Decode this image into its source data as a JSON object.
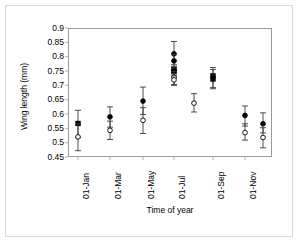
{
  "chart_data": {
    "type": "scatter",
    "title": "",
    "xlabel": "Time of year",
    "ylabel": "Wing length (mm)",
    "ylim": [
      0.45,
      0.9
    ],
    "yticks": [
      0.45,
      0.5,
      0.55,
      0.6,
      0.65,
      0.7,
      0.75,
      0.8,
      0.85,
      0.9
    ],
    "ytick_labels": [
      "0.45",
      "0.5",
      "0.55",
      "0.6",
      "0.65",
      "0.7",
      "0.75",
      "0.8",
      "0.85",
      "0.9"
    ],
    "xtick_labels": [
      "01-Jan",
      "01-Mar",
      "01-May",
      "01-Jul",
      "01-Sep",
      "01-Nov"
    ],
    "xtick_positions_px": [
      78,
      110,
      143,
      174,
      213,
      245
    ],
    "grid": false,
    "legend": null,
    "series": [
      {
        "name": "filled",
        "marker": "filled",
        "color": "#000000",
        "points": [
          {
            "x_px": 78,
            "y": 0.567,
            "err_low": 0.518,
            "err_high": 0.613,
            "shape": "square"
          },
          {
            "x_px": 110,
            "y": 0.59,
            "err_low": 0.554,
            "err_high": 0.625,
            "shape": "circle"
          },
          {
            "x_px": 143,
            "y": 0.645,
            "err_low": 0.598,
            "err_high": 0.694,
            "shape": "circle"
          },
          {
            "x_px": 174,
            "y": 0.81,
            "err_low": 0.787,
            "err_high": 0.853,
            "shape": "circle"
          },
          {
            "x_px": 174,
            "y": 0.785,
            "err_low": 0.762,
            "err_high": 0.808,
            "shape": "circle"
          },
          {
            "x_px": 174,
            "y": 0.753,
            "err_low": 0.733,
            "err_high": 0.772,
            "shape": "square"
          },
          {
            "x_px": 174,
            "y": 0.748,
            "err_low": 0.728,
            "err_high": 0.766,
            "shape": "square"
          },
          {
            "x_px": 213,
            "y": 0.733,
            "err_low": 0.692,
            "err_high": 0.762,
            "shape": "square"
          },
          {
            "x_px": 213,
            "y": 0.722,
            "err_low": 0.688,
            "err_high": 0.755,
            "shape": "square"
          },
          {
            "x_px": 245,
            "y": 0.595,
            "err_low": 0.558,
            "err_high": 0.628,
            "shape": "circle"
          },
          {
            "x_px": 263,
            "y": 0.566,
            "err_low": 0.534,
            "err_high": 0.604,
            "shape": "circle"
          }
        ]
      },
      {
        "name": "open",
        "marker": "open",
        "color": "#000000",
        "points": [
          {
            "x_px": 78,
            "y": 0.52,
            "err_low": 0.472,
            "err_high": 0.566,
            "shape": "circle"
          },
          {
            "x_px": 110,
            "y": 0.543,
            "err_low": 0.511,
            "err_high": 0.575,
            "shape": "circle"
          },
          {
            "x_px": 143,
            "y": 0.578,
            "err_low": 0.532,
            "err_high": 0.622,
            "shape": "circle"
          },
          {
            "x_px": 174,
            "y": 0.728,
            "err_low": 0.703,
            "err_high": 0.748,
            "shape": "circle"
          },
          {
            "x_px": 174,
            "y": 0.719,
            "err_low": 0.7,
            "err_high": 0.74,
            "shape": "circle"
          },
          {
            "x_px": 194,
            "y": 0.638,
            "err_low": 0.607,
            "err_high": 0.671,
            "shape": "circle"
          },
          {
            "x_px": 245,
            "y": 0.535,
            "err_low": 0.509,
            "err_high": 0.566,
            "shape": "circle"
          },
          {
            "x_px": 263,
            "y": 0.518,
            "err_low": 0.482,
            "err_high": 0.552,
            "shape": "circle"
          }
        ]
      }
    ]
  },
  "axes": {
    "ylabel": "Wing length (mm)",
    "xlabel": "Time of year",
    "ytick_labels": [
      "0.9",
      "0.85",
      "0.8",
      "0.75",
      "0.7",
      "0.65",
      "0.6",
      "0.55",
      "0.5",
      "0.45"
    ],
    "xtick_labels": [
      "01-Jan",
      "01-Mar",
      "01-May",
      "01-Jul",
      "01-Sep",
      "01-Nov"
    ]
  }
}
